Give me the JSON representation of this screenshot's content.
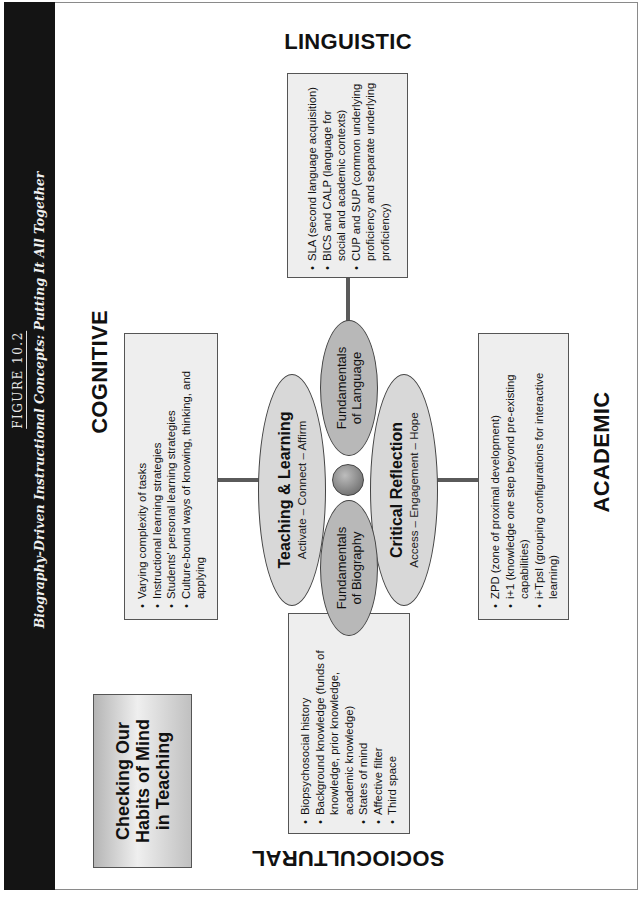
{
  "figure": {
    "number": "FIGURE 10.2",
    "title": "Biography-Driven Instructional Concepts: Putting It All Together"
  },
  "callout": {
    "lines": [
      "Checking Our",
      "Habits of Mind",
      "in Teaching"
    ]
  },
  "quadrants": {
    "linguistic": {
      "label": "LINGUISTIC",
      "items": [
        "SLA (second language acquisition)",
        "BICS and CALP (language for social and academic contexts)",
        "CUP and SUP (common underlying proficiency and separate underlying proficiency)"
      ]
    },
    "cognitive": {
      "label": "COGNITIVE",
      "items": [
        "Varying complexity of tasks",
        "Instructional learning strategies",
        "Students' personal learning strategies",
        "Culture-bound ways of knowing, thinking, and applying"
      ]
    },
    "academic": {
      "label": "ACADEMIC",
      "items": [
        "ZPD (zone of proximal development)",
        "i+1 (knowledge one step beyond pre-existing capabilities)",
        "i+TpsI (grouping configurations for interactive learning)"
      ]
    },
    "sociocultural": {
      "label": "SOCIOCULTURAL",
      "items": [
        "Biopsychosocial history",
        "Background knowledge (funds of knowledge, prior knowledge, academic knowledge)",
        "States of mind",
        "Affective filter",
        "Third space"
      ]
    }
  },
  "center": {
    "teaching": {
      "title": "Teaching & Learning",
      "subtitle": "Activate – Connect – Affirm"
    },
    "reflection": {
      "title": "Critical Reflection",
      "subtitle": "Access – Engagement – Hope"
    },
    "language": {
      "lines": [
        "Fundamentals",
        "of Language"
      ]
    },
    "biography": {
      "lines": [
        "Fundamentals",
        "of Biography"
      ]
    }
  }
}
